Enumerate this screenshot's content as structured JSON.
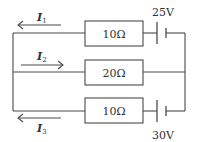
{
  "diagram": {
    "type": "circuit",
    "branches": [
      {
        "id": "top",
        "resistor_label": "10Ω",
        "battery_label": "25V",
        "current": {
          "symbol": "I",
          "subscript": "1",
          "direction": "left"
        }
      },
      {
        "id": "middle",
        "resistor_label": "20Ω",
        "battery_label": null,
        "current": {
          "symbol": "I",
          "subscript": "2",
          "direction": "right"
        }
      },
      {
        "id": "bottom",
        "resistor_label": "10Ω",
        "battery_label": "30V",
        "current": {
          "symbol": "I",
          "subscript": "3",
          "direction": "left"
        }
      }
    ],
    "colors": {
      "line": "#4a4a4a",
      "text": "#333333",
      "background": "#ffffff"
    }
  }
}
